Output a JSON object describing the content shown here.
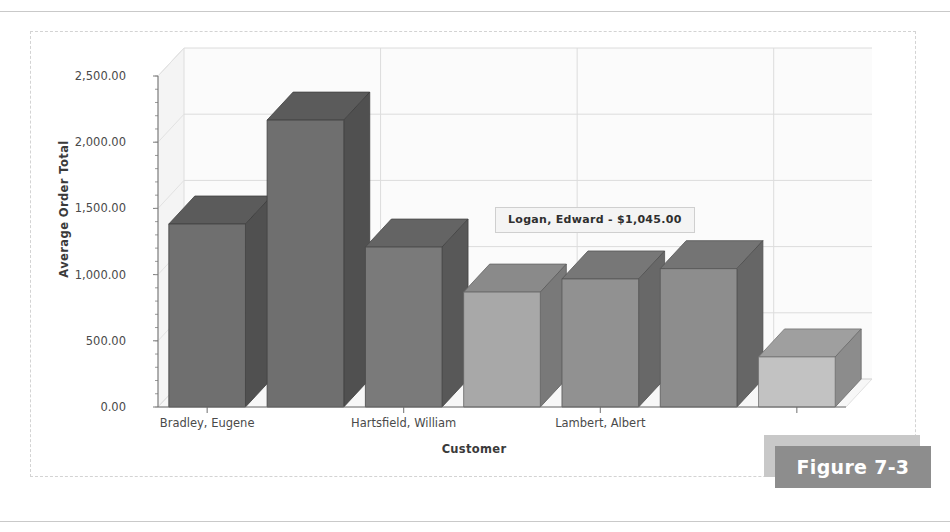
{
  "figure": {
    "tag_label": "Figure 7-3"
  },
  "tooltip": {
    "text": "Logan, Edward - $1,045.00"
  },
  "chart_data": {
    "type": "bar",
    "title": "",
    "subtitle": "",
    "xlabel": "Customer",
    "ylabel": "Average Order Total",
    "ylim": [
      0,
      2500
    ],
    "ytick_labels": [
      "0.00",
      "500.00",
      "1,000.00",
      "1,500.00",
      "2,000.00",
      "2,500.00"
    ],
    "ytick_values": [
      0,
      500,
      1000,
      1500,
      2000,
      2500
    ],
    "grid": true,
    "legend": "none",
    "three_d": true,
    "categories": [
      "Bradley, Eugene",
      "",
      "Hartsfield, William",
      "",
      "Lambert, Albert",
      "",
      ""
    ],
    "visible_xtick_labels": [
      "Bradley, Eugene",
      "Hartsfield, William",
      "Lambert, Albert"
    ],
    "values": [
      1382,
      2167,
      1208,
      868,
      967,
      1045,
      378
    ],
    "bar_colors": [
      "#6f6f6f",
      "#6f6f6f",
      "#7a7a7a",
      "#a8a8a8",
      "#919191",
      "#8d8d8d",
      "#c2c2c2"
    ],
    "highlighted_index": 5,
    "highlighted_label": "Logan, Edward",
    "highlighted_value": 1045.0,
    "highlighted_value_text": "$1,045.00"
  }
}
